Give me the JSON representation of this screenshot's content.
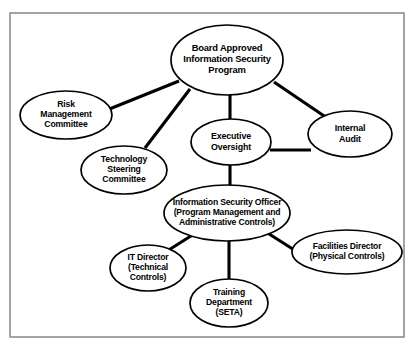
{
  "diagram": {
    "type": "organizational-chart",
    "background_color": "#ffffff",
    "frame": {
      "stroke_color": "#8e8e8e",
      "x": 10,
      "y": 13,
      "width": 394,
      "height": 324
    },
    "node_style": {
      "shape": "ellipse",
      "fill_color": "#ffffff",
      "stroke_color": "#000000",
      "text_color": "#000000"
    },
    "edge_style": {
      "stroke_color": "#000000",
      "stroke_width": 3
    },
    "nodes": [
      {
        "id": "board",
        "label": "Board Approved Information Security Program",
        "lines": [
          "Board Approved",
          "Information Security",
          "Program"
        ],
        "cx": 227,
        "cy": 60,
        "rx": 56,
        "ry": 35,
        "font_size": 9.4,
        "line_height": 11.4
      },
      {
        "id": "risk",
        "label": "Risk Management Committee",
        "lines": [
          "Risk",
          "Management",
          "Committee"
        ],
        "cx": 66,
        "cy": 115,
        "rx": 46,
        "ry": 24,
        "font_size": 8.7,
        "line_height": 10.4
      },
      {
        "id": "technology",
        "label": "Technology Steering Committee",
        "lines": [
          "Technology",
          "Steering",
          "Committee"
        ],
        "cx": 124,
        "cy": 170,
        "rx": 43,
        "ry": 24,
        "font_size": 8.7,
        "line_height": 10.4
      },
      {
        "id": "executive",
        "label": "Executive Oversight",
        "lines": [
          "Executive",
          "Oversight"
        ],
        "cx": 231,
        "cy": 142,
        "rx": 40,
        "ry": 23,
        "font_size": 8.9,
        "line_height": 11.0
      },
      {
        "id": "audit",
        "label": "Internal Audit",
        "lines": [
          "Internal",
          "Audit"
        ],
        "cx": 350,
        "cy": 134,
        "rx": 42,
        "ry": 23,
        "font_size": 8.9,
        "line_height": 11.0
      },
      {
        "id": "iso",
        "label": "Information Security Officer (Program Management and Administrative Controls)",
        "lines": [
          "Information Security Officer",
          "(Program Management and",
          "Administrative Controls)"
        ],
        "cx": 227,
        "cy": 213,
        "rx": 63,
        "ry": 28,
        "font_size": 8.6,
        "line_height": 10.4
      },
      {
        "id": "it-director",
        "label": "IT Director (Technical Controls)",
        "lines": [
          "IT Director",
          "(Technical",
          "Controls)"
        ],
        "cx": 148,
        "cy": 268,
        "rx": 38,
        "ry": 23,
        "font_size": 8.6,
        "line_height": 10.2
      },
      {
        "id": "training",
        "label": "Training Department (SETA)",
        "lines": [
          "Training",
          "Department",
          "(SETA)"
        ],
        "cx": 229,
        "cy": 303,
        "rx": 39,
        "ry": 24,
        "font_size": 8.6,
        "line_height": 10.2
      },
      {
        "id": "facilities",
        "label": "Facilities Director (Physical Controls)",
        "lines": [
          "Facilities Director",
          "(Physical Controls)"
        ],
        "cx": 347,
        "cy": 252,
        "rx": 55,
        "ry": 22,
        "font_size": 8.6,
        "line_height": 10.4
      }
    ],
    "edges": [
      {
        "id": "board-risk",
        "from": "board",
        "to": "risk",
        "x1": 179,
        "y1": 81,
        "x2": 102,
        "y2": 112
      },
      {
        "id": "board-technology",
        "from": "board",
        "to": "technology",
        "x1": 190,
        "y1": 89,
        "x2": 145,
        "y2": 148
      },
      {
        "id": "board-executive",
        "from": "board",
        "to": "executive",
        "x1": 230,
        "y1": 95,
        "x2": 230,
        "y2": 120
      },
      {
        "id": "board-audit",
        "from": "board",
        "to": "audit",
        "x1": 274,
        "y1": 82,
        "x2": 330,
        "y2": 120
      },
      {
        "id": "executive-audit",
        "from": "executive",
        "to": "audit",
        "x1": 270,
        "y1": 150,
        "x2": 311,
        "y2": 150
      },
      {
        "id": "executive-iso",
        "from": "executive",
        "to": "iso",
        "x1": 230,
        "y1": 165,
        "x2": 230,
        "y2": 186
      },
      {
        "id": "iso-it-director",
        "from": "iso",
        "to": "it-director",
        "x1": 194,
        "y1": 234,
        "x2": 164,
        "y2": 253
      },
      {
        "id": "iso-training",
        "from": "iso",
        "to": "training",
        "x1": 229,
        "y1": 241,
        "x2": 229,
        "y2": 280
      },
      {
        "id": "iso-facilities",
        "from": "iso",
        "to": "facilities",
        "x1": 266,
        "y1": 232,
        "x2": 299,
        "y2": 253
      }
    ]
  }
}
